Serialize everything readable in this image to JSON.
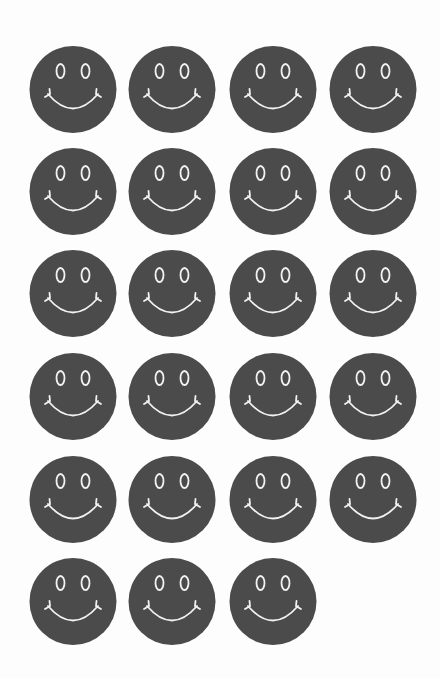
{
  "sheet": {
    "background": "#fdfdfd",
    "face_color": "#4b4b4b",
    "feature_color": "#f2f2f2",
    "columns": 4,
    "rows": 6,
    "total_faces": 23,
    "column_x": [
      29,
      128,
      229,
      329
    ],
    "row_y": [
      45,
      147,
      249,
      352,
      455,
      557
    ],
    "layout": [
      {
        "row": 1,
        "count": 4
      },
      {
        "row": 2,
        "count": 4
      },
      {
        "row": 3,
        "count": 4
      },
      {
        "row": 4,
        "count": 4
      },
      {
        "row": 5,
        "count": 4
      },
      {
        "row": 6,
        "count": 3
      }
    ]
  },
  "icon": {
    "name": "smiley-face-icon",
    "eyes": "oval-outline",
    "mouth": "arc-with-end-ticks"
  }
}
